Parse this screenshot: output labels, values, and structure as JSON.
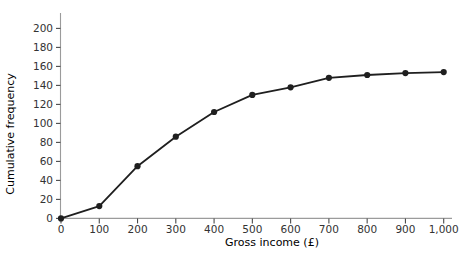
{
  "chart_data": {
    "type": "line",
    "title": "",
    "xlabel": "Gross income (£)",
    "ylabel": "Cumulative frequency",
    "x": [
      0,
      100,
      200,
      300,
      400,
      500,
      600,
      700,
      800,
      900,
      1000
    ],
    "y": [
      0,
      13,
      55,
      86,
      112,
      130,
      138,
      148,
      151,
      153,
      154
    ],
    "xlim": [
      0,
      1000
    ],
    "ylim": [
      0,
      200
    ],
    "x_tick_labels": [
      "0",
      "100",
      "200",
      "300",
      "400",
      "500",
      "600",
      "700",
      "800",
      "900",
      "1,000"
    ],
    "y_tick_values": [
      0,
      20,
      40,
      60,
      80,
      100,
      120,
      140,
      160,
      180,
      200
    ],
    "grid": false,
    "marker": "filled-circle",
    "colors": {
      "line": "#1f1f1f",
      "marker": "#1f1f1f",
      "axis": "#9b9b9b",
      "tick": "#4a4a4a",
      "label": "#333333"
    }
  }
}
